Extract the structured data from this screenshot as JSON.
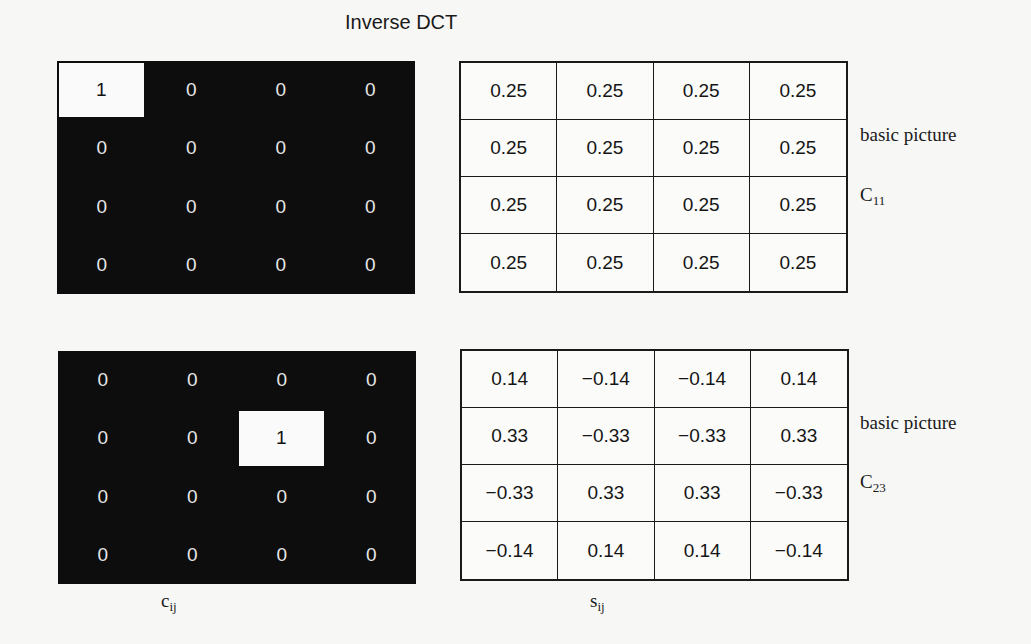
{
  "title": "Inverse DCT",
  "panels": [
    {
      "coefficients": [
        [
          "1",
          "0",
          "0",
          "0"
        ],
        [
          "0",
          "0",
          "0",
          "0"
        ],
        [
          "0",
          "0",
          "0",
          "0"
        ],
        [
          "0",
          "0",
          "0",
          "0"
        ]
      ],
      "active_cell": [
        0,
        0
      ],
      "pixels": [
        [
          "0.25",
          "0.25",
          "0.25",
          "0.25"
        ],
        [
          "0.25",
          "0.25",
          "0.25",
          "0.25"
        ],
        [
          "0.25",
          "0.25",
          "0.25",
          "0.25"
        ],
        [
          "0.25",
          "0.25",
          "0.25",
          "0.25"
        ]
      ],
      "label_line1": "basic picture",
      "label_symbol": "C",
      "label_sub": "11"
    },
    {
      "coefficients": [
        [
          "0",
          "0",
          "0",
          "0"
        ],
        [
          "0",
          "0",
          "1",
          "0"
        ],
        [
          "0",
          "0",
          "0",
          "0"
        ],
        [
          "0",
          "0",
          "0",
          "0"
        ]
      ],
      "active_cell": [
        1,
        2
      ],
      "pixels": [
        [
          "0.14",
          "−0.14",
          "−0.14",
          "0.14"
        ],
        [
          "0.33",
          "−0.33",
          "−0.33",
          "0.33"
        ],
        [
          "−0.33",
          "0.33",
          "0.33",
          "−0.33"
        ],
        [
          "−0.14",
          "0.14",
          "0.14",
          "−0.14"
        ]
      ],
      "label_line1": "basic picture",
      "label_symbol": "C",
      "label_sub": "23"
    }
  ],
  "axis_labels": {
    "coef_symbol": "c",
    "coef_sub": "ij",
    "pixel_symbol": "s",
    "pixel_sub": "ij"
  },
  "colors": {
    "coef_background": "#0d0d0d",
    "active_cell": "#fafafa",
    "grid_line": "#1a1a1a"
  }
}
